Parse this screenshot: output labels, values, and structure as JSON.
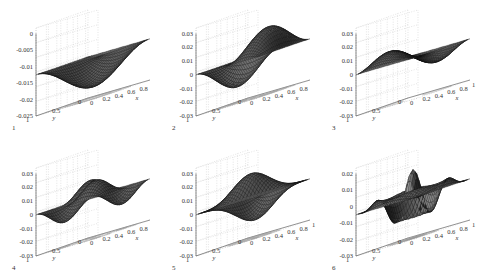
{
  "figure": {
    "panels": [
      {
        "number": "1",
        "zticks": [
          "0",
          "-0.005",
          "-0.01",
          "-0.015",
          "-0.02",
          "-0.025"
        ],
        "yticks": [
          "1",
          "0.5",
          "0"
        ],
        "xticks": [
          "0",
          "0.2",
          "0.4",
          "0.6",
          "0.8"
        ],
        "xlabel": "x",
        "ylabel": "y",
        "shape": "bowl"
      },
      {
        "number": "2",
        "zticks": [
          "0.03",
          "0.02",
          "0.01",
          "0",
          "-0.01",
          "-0.02",
          "-0.03"
        ],
        "yticks": [
          "1",
          "0.5",
          "0"
        ],
        "xticks": [
          "0",
          "0.2",
          "0.4",
          "0.6",
          "0.8"
        ],
        "xlabel": "x",
        "ylabel": "y",
        "shape": "antisymmetric-x"
      },
      {
        "number": "3",
        "zticks": [
          "0.03",
          "0.02",
          "0.01",
          "0",
          "-0.01",
          "-0.02",
          "-0.03"
        ],
        "yticks": [
          "1",
          "0.5",
          "0"
        ],
        "xticks": [
          "1",
          "0.8",
          "0.6",
          "0.4",
          "0.2",
          "0"
        ],
        "xlabel": "x",
        "ylabel": "y",
        "shape": "antisymmetric-diag"
      },
      {
        "number": "4",
        "zticks": [
          "0.03",
          "0.02",
          "0.01",
          "0",
          "-0.01",
          "-0.02",
          "-0.03"
        ],
        "yticks": [
          "1",
          "0.5",
          "0"
        ],
        "xticks": [
          "0",
          "0.2",
          "0.4",
          "0.6",
          "0.8"
        ],
        "xlabel": "x",
        "ylabel": "y",
        "shape": "saddle"
      },
      {
        "number": "5",
        "zticks": [
          "0.03",
          "0.02",
          "0.01",
          "0",
          "-0.01",
          "-0.02",
          "-0.03"
        ],
        "yticks": [
          "1",
          "0.5",
          "0"
        ],
        "xticks": [
          "1",
          "0.8",
          "0.6",
          "0.4",
          "0.2",
          "0"
        ],
        "xlabel": "x",
        "ylabel": "y",
        "shape": "diag-lobes"
      },
      {
        "number": "6",
        "zticks": [
          "0.02",
          "0.01",
          "0",
          "-0.01",
          "-0.02",
          "-0.03"
        ],
        "yticks": [
          "1",
          "0.5",
          "0"
        ],
        "xticks": [
          "1",
          "0.8",
          "0.6",
          "0.4",
          "0.2",
          "0"
        ],
        "xlabel": "x",
        "ylabel": "y",
        "shape": "ring"
      }
    ]
  },
  "chart_data": [
    {
      "type": "surface",
      "title": "1",
      "xlabel": "x",
      "ylabel": "y",
      "zlim": [
        -0.025,
        0
      ],
      "xlim": [
        0,
        1
      ],
      "ylim": [
        0,
        1
      ],
      "xticks": [
        0,
        0.2,
        0.4,
        0.6,
        0.8
      ],
      "yticks": [
        0,
        0.5,
        1
      ],
      "zticks": [
        -0.025,
        -0.02,
        -0.015,
        -0.01,
        -0.005,
        0
      ],
      "grid": true,
      "contour_projection": true
    },
    {
      "type": "surface",
      "title": "2",
      "xlabel": "x",
      "ylabel": "y",
      "zlim": [
        -0.03,
        0.03
      ],
      "xlim": [
        0,
        1
      ],
      "ylim": [
        0,
        1
      ],
      "xticks": [
        0,
        0.2,
        0.4,
        0.6,
        0.8
      ],
      "yticks": [
        0,
        0.5,
        1
      ],
      "zticks": [
        -0.03,
        -0.02,
        -0.01,
        0,
        0.01,
        0.02,
        0.03
      ],
      "grid": true,
      "contour_projection": true
    },
    {
      "type": "surface",
      "title": "3",
      "xlabel": "x",
      "ylabel": "y",
      "zlim": [
        -0.03,
        0.03
      ],
      "xlim": [
        0,
        1
      ],
      "ylim": [
        0,
        1
      ],
      "xticks": [
        0,
        0.2,
        0.4,
        0.6,
        0.8,
        1
      ],
      "yticks": [
        0,
        0.5,
        1
      ],
      "zticks": [
        -0.03,
        -0.02,
        -0.01,
        0,
        0.01,
        0.02,
        0.03
      ],
      "grid": true,
      "contour_projection": true
    },
    {
      "type": "surface",
      "title": "4",
      "xlabel": "x",
      "ylabel": "y",
      "zlim": [
        -0.03,
        0.03
      ],
      "xlim": [
        0,
        1
      ],
      "ylim": [
        0,
        1
      ],
      "xticks": [
        0,
        0.2,
        0.4,
        0.6,
        0.8
      ],
      "yticks": [
        0,
        0.5,
        1
      ],
      "zticks": [
        -0.03,
        -0.02,
        -0.01,
        0,
        0.01,
        0.02,
        0.03
      ],
      "grid": true,
      "contour_projection": true
    },
    {
      "type": "surface",
      "title": "5",
      "xlabel": "x",
      "ylabel": "y",
      "zlim": [
        -0.03,
        0.03
      ],
      "xlim": [
        0,
        1
      ],
      "ylim": [
        0,
        1
      ],
      "xticks": [
        0,
        0.2,
        0.4,
        0.6,
        0.8,
        1
      ],
      "yticks": [
        0,
        0.5,
        1
      ],
      "zticks": [
        -0.03,
        -0.02,
        -0.01,
        0,
        0.01,
        0.02,
        0.03
      ],
      "grid": true,
      "contour_projection": true
    },
    {
      "type": "surface",
      "title": "6",
      "xlabel": "x",
      "ylabel": "y",
      "zlim": [
        -0.03,
        0.02
      ],
      "xlim": [
        0,
        1
      ],
      "ylim": [
        0,
        1
      ],
      "xticks": [
        0,
        0.2,
        0.4,
        0.6,
        0.8,
        1
      ],
      "yticks": [
        0,
        0.5,
        1
      ],
      "zticks": [
        -0.03,
        -0.02,
        -0.01,
        0,
        0.01,
        0.02
      ],
      "grid": true,
      "contour_projection": true
    }
  ]
}
